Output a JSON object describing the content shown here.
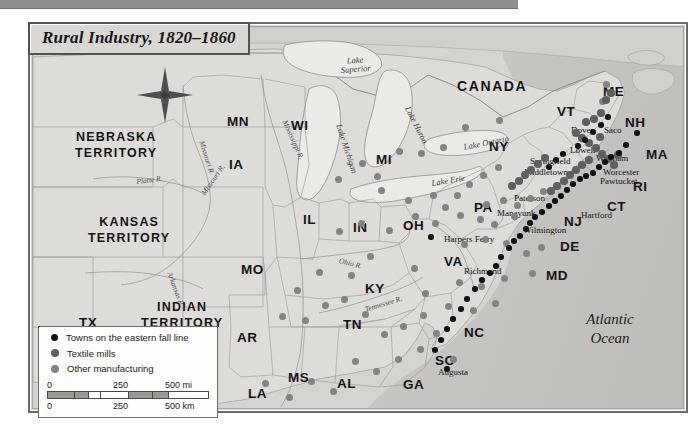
{
  "title": {
    "text": "Rural Industry, 1820–1860"
  },
  "ocean": {
    "line1": "Atlantic",
    "line2": "Ocean"
  },
  "compass": {
    "north_label": "N"
  },
  "legend": {
    "items": [
      {
        "label": "Towns on the eastern fall line",
        "marker": "black-dot",
        "color": "#111114",
        "size": 7
      },
      {
        "label": "Textile mills",
        "marker": "dark-gray-dot",
        "color": "#5f5e60",
        "size": 8
      },
      {
        "label": "Other manufacturing",
        "marker": "gray-dot",
        "color": "#838284",
        "size": 8
      }
    ],
    "scale": {
      "miles": {
        "ticks": [
          "0",
          "250",
          "500 mi"
        ],
        "unit": "mi"
      },
      "km": {
        "ticks": [
          "0",
          "250",
          "500 km"
        ],
        "unit": "km"
      }
    }
  },
  "map": {
    "country_labels": [
      {
        "name": "CANADA",
        "x": 424,
        "y": 52
      }
    ],
    "territories": [
      {
        "line1": "NEBRASKA",
        "line2": "TERRITORY",
        "x": 42,
        "y": 104
      },
      {
        "line1": "KANSAS",
        "line2": "TERRITORY",
        "x": 55,
        "y": 189
      },
      {
        "line1": "INDIAN",
        "line2": "TERRITORY",
        "x": 108,
        "y": 274
      }
    ],
    "states": [
      {
        "name": "ME",
        "x": 570,
        "y": 58,
        "size": "md"
      },
      {
        "name": "NH",
        "x": 592,
        "y": 89,
        "size": "md"
      },
      {
        "name": "VT",
        "x": 524,
        "y": 78,
        "size": "md"
      },
      {
        "name": "MA",
        "x": 613,
        "y": 121,
        "size": "md"
      },
      {
        "name": "RI",
        "x": 600,
        "y": 153,
        "size": "md"
      },
      {
        "name": "CT",
        "x": 574,
        "y": 173,
        "size": "md"
      },
      {
        "name": "NY",
        "x": 456,
        "y": 113,
        "size": "md"
      },
      {
        "name": "NJ",
        "x": 531,
        "y": 188,
        "size": "md"
      },
      {
        "name": "PA",
        "x": 441,
        "y": 174,
        "size": "md"
      },
      {
        "name": "DE",
        "x": 527,
        "y": 213,
        "size": "md"
      },
      {
        "name": "MD",
        "x": 513,
        "y": 242,
        "size": "md"
      },
      {
        "name": "VA",
        "x": 411,
        "y": 228,
        "size": "md"
      },
      {
        "name": "NC",
        "x": 431,
        "y": 299,
        "size": "md"
      },
      {
        "name": "SC",
        "x": 402,
        "y": 327,
        "size": "md"
      },
      {
        "name": "GA",
        "x": 370,
        "y": 351,
        "size": "md"
      },
      {
        "name": "AL",
        "x": 304,
        "y": 350,
        "size": "md"
      },
      {
        "name": "MS",
        "x": 255,
        "y": 344,
        "size": "md"
      },
      {
        "name": "LA",
        "x": 215,
        "y": 360,
        "size": "md"
      },
      {
        "name": "AR",
        "x": 204,
        "y": 304,
        "size": "md"
      },
      {
        "name": "TN",
        "x": 310,
        "y": 291,
        "size": "md"
      },
      {
        "name": "KY",
        "x": 332,
        "y": 255,
        "size": "md"
      },
      {
        "name": "OH",
        "x": 370,
        "y": 192,
        "size": "md"
      },
      {
        "name": "IN",
        "x": 320,
        "y": 194,
        "size": "md"
      },
      {
        "name": "IL",
        "x": 270,
        "y": 186,
        "size": "md"
      },
      {
        "name": "MO",
        "x": 208,
        "y": 236,
        "size": "md"
      },
      {
        "name": "IA",
        "x": 196,
        "y": 131,
        "size": "md"
      },
      {
        "name": "MI",
        "x": 343,
        "y": 126,
        "size": "md"
      },
      {
        "name": "WI",
        "x": 258,
        "y": 92,
        "size": "md"
      },
      {
        "name": "MN",
        "x": 194,
        "y": 88,
        "size": "md"
      },
      {
        "name": "TX",
        "x": 46,
        "y": 289,
        "size": "md"
      }
    ],
    "cities": [
      {
        "name": "Dover",
        "x": 538,
        "y": 99,
        "anchor": "left"
      },
      {
        "name": "Saco",
        "x": 571,
        "y": 99,
        "anchor": "left"
      },
      {
        "name": "Lowell",
        "x": 537,
        "y": 119,
        "anchor": "left"
      },
      {
        "name": "Waltham",
        "x": 563,
        "y": 127,
        "anchor": "left"
      },
      {
        "name": "Worcester",
        "x": 570,
        "y": 141,
        "anchor": "left"
      },
      {
        "name": "Pawtucket",
        "x": 567,
        "y": 150,
        "anchor": "left"
      },
      {
        "name": "Springfield",
        "x": 497,
        "y": 130,
        "anchor": "left"
      },
      {
        "name": "Middletown",
        "x": 491,
        "y": 141,
        "anchor": "left"
      },
      {
        "name": "Hartford",
        "x": 548,
        "y": 184,
        "anchor": "left"
      },
      {
        "name": "Paterson",
        "x": 481,
        "y": 167,
        "anchor": "left"
      },
      {
        "name": "Manayunk",
        "x": 464,
        "y": 182,
        "anchor": "left"
      },
      {
        "name": "Wilmington",
        "x": 490,
        "y": 199,
        "anchor": "left"
      },
      {
        "name": "Harpers Ferry",
        "x": 411,
        "y": 208,
        "anchor": "left"
      },
      {
        "name": "Richmond",
        "x": 431,
        "y": 240,
        "anchor": "left"
      },
      {
        "name": "Augusta",
        "x": 405,
        "y": 341,
        "anchor": "left"
      }
    ],
    "lakes": [
      {
        "name": "Lake\nSuperior",
        "x": 307,
        "y": 30,
        "rot": -4
      },
      {
        "name": "Lake Michigan",
        "x": 310,
        "y": 96,
        "rot": 72
      },
      {
        "name": "Lake Huron",
        "x": 378,
        "y": 78,
        "rot": 63
      },
      {
        "name": "Lake Erie",
        "x": 398,
        "y": 152,
        "rot": -9
      },
      {
        "name": "Lake Ontario",
        "x": 430,
        "y": 116,
        "rot": -11
      }
    ],
    "rivers": [
      {
        "name": "Mississippi R.",
        "x": 255,
        "y": 92,
        "rot": 66
      },
      {
        "name": "Missouri R.",
        "x": 172,
        "y": 113,
        "rot": 72
      },
      {
        "name": "Missouri R.",
        "x": 167,
        "y": 165,
        "rot": -55
      },
      {
        "name": "Platte R.",
        "x": 103,
        "y": 151,
        "rot": -7
      },
      {
        "name": "Arkansas R.",
        "x": 140,
        "y": 244,
        "rot": 70
      },
      {
        "name": "Ohio R.",
        "x": 307,
        "y": 230,
        "rot": 14
      },
      {
        "name": "Tennessee R.",
        "x": 331,
        "y": 279,
        "rot": -17
      }
    ],
    "points": {
      "fall_line": [
        {
          "x": 604,
          "y": 106
        },
        {
          "x": 593,
          "y": 118
        },
        {
          "x": 586,
          "y": 126
        },
        {
          "x": 578,
          "y": 130
        },
        {
          "x": 572,
          "y": 135
        },
        {
          "x": 566,
          "y": 140
        },
        {
          "x": 560,
          "y": 146
        },
        {
          "x": 553,
          "y": 149
        },
        {
          "x": 547,
          "y": 152
        },
        {
          "x": 540,
          "y": 157
        },
        {
          "x": 534,
          "y": 163
        },
        {
          "x": 528,
          "y": 169
        },
        {
          "x": 522,
          "y": 174
        },
        {
          "x": 516,
          "y": 179
        },
        {
          "x": 509,
          "y": 185
        },
        {
          "x": 502,
          "y": 190
        },
        {
          "x": 497,
          "y": 196
        },
        {
          "x": 493,
          "y": 202
        },
        {
          "x": 487,
          "y": 209
        },
        {
          "x": 481,
          "y": 214
        },
        {
          "x": 476,
          "y": 221
        },
        {
          "x": 468,
          "y": 230
        },
        {
          "x": 463,
          "y": 239
        },
        {
          "x": 457,
          "y": 246
        },
        {
          "x": 449,
          "y": 253
        },
        {
          "x": 442,
          "y": 262
        },
        {
          "x": 434,
          "y": 272
        },
        {
          "x": 428,
          "y": 282
        },
        {
          "x": 420,
          "y": 292
        },
        {
          "x": 414,
          "y": 302
        },
        {
          "x": 408,
          "y": 313
        },
        {
          "x": 402,
          "y": 323
        },
        {
          "x": 414,
          "y": 342
        },
        {
          "x": 398,
          "y": 210
        },
        {
          "x": 516,
          "y": 140
        },
        {
          "x": 523,
          "y": 133
        },
        {
          "x": 530,
          "y": 127
        },
        {
          "x": 545,
          "y": 119
        },
        {
          "x": 552,
          "y": 113
        },
        {
          "x": 560,
          "y": 105
        },
        {
          "x": 568,
          "y": 98
        },
        {
          "x": 575,
          "y": 90
        }
      ],
      "textile": [
        {
          "x": 553,
          "y": 95
        },
        {
          "x": 561,
          "y": 92
        },
        {
          "x": 568,
          "y": 86
        },
        {
          "x": 543,
          "y": 106
        },
        {
          "x": 549,
          "y": 111
        },
        {
          "x": 556,
          "y": 116
        },
        {
          "x": 563,
          "y": 121
        },
        {
          "x": 569,
          "y": 127
        },
        {
          "x": 575,
          "y": 132
        },
        {
          "x": 581,
          "y": 138
        },
        {
          "x": 556,
          "y": 133
        },
        {
          "x": 549,
          "y": 138
        },
        {
          "x": 543,
          "y": 143
        },
        {
          "x": 537,
          "y": 148
        },
        {
          "x": 531,
          "y": 154
        },
        {
          "x": 524,
          "y": 159
        },
        {
          "x": 518,
          "y": 164
        },
        {
          "x": 512,
          "y": 131
        },
        {
          "x": 505,
          "y": 137
        },
        {
          "x": 498,
          "y": 143
        },
        {
          "x": 492,
          "y": 148
        },
        {
          "x": 486,
          "y": 154
        },
        {
          "x": 479,
          "y": 159
        },
        {
          "x": 573,
          "y": 73
        },
        {
          "x": 578,
          "y": 66
        },
        {
          "x": 567,
          "y": 110
        },
        {
          "x": 585,
          "y": 128
        }
      ],
      "other": [
        {
          "x": 305,
          "y": 152
        },
        {
          "x": 348,
          "y": 163
        },
        {
          "x": 375,
          "y": 173
        },
        {
          "x": 400,
          "y": 168
        },
        {
          "x": 412,
          "y": 180
        },
        {
          "x": 424,
          "y": 168
        },
        {
          "x": 436,
          "y": 157
        },
        {
          "x": 450,
          "y": 148
        },
        {
          "x": 465,
          "y": 140
        },
        {
          "x": 466,
          "y": 93
        },
        {
          "x": 432,
          "y": 100
        },
        {
          "x": 410,
          "y": 120
        },
        {
          "x": 388,
          "y": 126
        },
        {
          "x": 366,
          "y": 124
        },
        {
          "x": 344,
          "y": 149
        },
        {
          "x": 329,
          "y": 136
        },
        {
          "x": 306,
          "y": 204
        },
        {
          "x": 328,
          "y": 196
        },
        {
          "x": 356,
          "y": 203
        },
        {
          "x": 382,
          "y": 189
        },
        {
          "x": 402,
          "y": 196
        },
        {
          "x": 427,
          "y": 188
        },
        {
          "x": 447,
          "y": 192
        },
        {
          "x": 461,
          "y": 197
        },
        {
          "x": 453,
          "y": 177
        },
        {
          "x": 470,
          "y": 173
        },
        {
          "x": 484,
          "y": 178
        },
        {
          "x": 497,
          "y": 171
        },
        {
          "x": 510,
          "y": 164
        },
        {
          "x": 431,
          "y": 217
        },
        {
          "x": 452,
          "y": 212
        },
        {
          "x": 473,
          "y": 216
        },
        {
          "x": 493,
          "y": 226
        },
        {
          "x": 508,
          "y": 220
        },
        {
          "x": 426,
          "y": 255
        },
        {
          "x": 448,
          "y": 259
        },
        {
          "x": 471,
          "y": 251
        },
        {
          "x": 415,
          "y": 279
        },
        {
          "x": 440,
          "y": 283
        },
        {
          "x": 462,
          "y": 276
        },
        {
          "x": 390,
          "y": 288
        },
        {
          "x": 370,
          "y": 299
        },
        {
          "x": 351,
          "y": 307
        },
        {
          "x": 332,
          "y": 287
        },
        {
          "x": 311,
          "y": 272
        },
        {
          "x": 292,
          "y": 278
        },
        {
          "x": 272,
          "y": 293
        },
        {
          "x": 249,
          "y": 289
        },
        {
          "x": 387,
          "y": 322
        },
        {
          "x": 365,
          "y": 332
        },
        {
          "x": 343,
          "y": 344
        },
        {
          "x": 322,
          "y": 334
        },
        {
          "x": 300,
          "y": 364
        },
        {
          "x": 278,
          "y": 354
        },
        {
          "x": 256,
          "y": 370
        },
        {
          "x": 232,
          "y": 356
        },
        {
          "x": 216,
          "y": 390
        },
        {
          "x": 403,
          "y": 306
        },
        {
          "x": 420,
          "y": 332
        },
        {
          "x": 392,
          "y": 266
        },
        {
          "x": 337,
          "y": 229
        },
        {
          "x": 318,
          "y": 248
        },
        {
          "x": 286,
          "y": 245
        },
        {
          "x": 264,
          "y": 263
        },
        {
          "x": 381,
          "y": 241
        },
        {
          "x": 499,
          "y": 246
        },
        {
          "x": 481,
          "y": 189
        },
        {
          "x": 569,
          "y": 74
        },
        {
          "x": 573,
          "y": 57
        }
      ]
    }
  }
}
